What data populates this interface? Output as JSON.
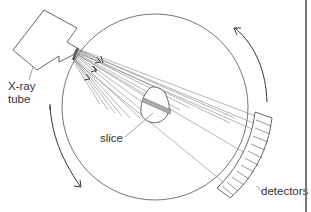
{
  "diagram": {
    "labels": {
      "xray_tube_line1": "X-ray",
      "xray_tube_line2": "tube",
      "slice": "slice",
      "detectors": "detectors"
    },
    "components": [
      "X-ray tube",
      "fan beam",
      "gantry ring",
      "slice",
      "detector array",
      "rotation arrows"
    ],
    "rotation": "clockwise",
    "colors": {
      "line": "#555555",
      "arrow": "#333333",
      "slice_fill": "#aaaaaa",
      "background": "#ffffff"
    }
  }
}
